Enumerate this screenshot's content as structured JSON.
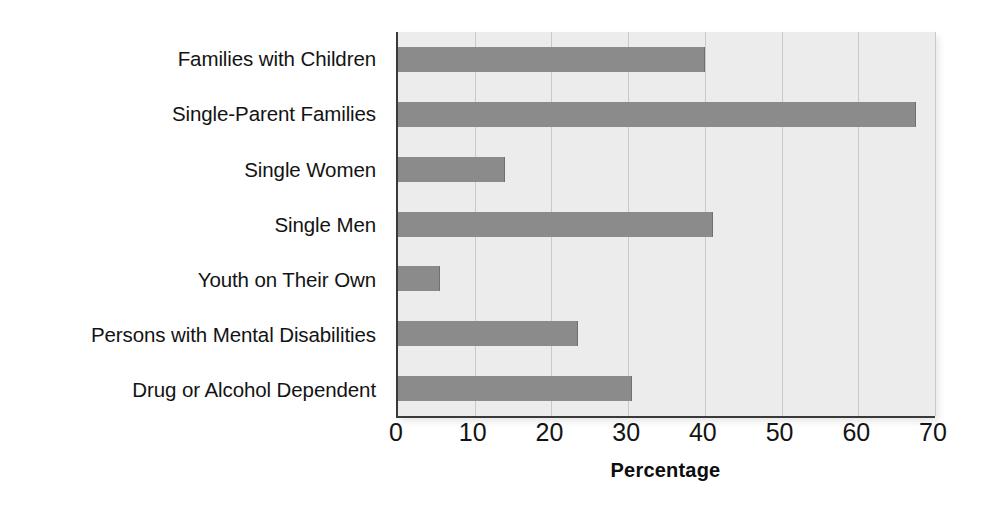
{
  "chart_data": {
    "type": "bar",
    "orientation": "horizontal",
    "title": "",
    "xlabel": "Percentage",
    "ylabel": "",
    "xlim": [
      0,
      70
    ],
    "xticks": [
      0,
      10,
      20,
      30,
      40,
      50,
      60,
      70
    ],
    "xtick_labels": [
      "0",
      "10",
      "20",
      "30",
      "40",
      "50",
      "60",
      "70"
    ],
    "grid": true,
    "legend": false,
    "categories": [
      "Families with Children",
      "Single-Parent Families",
      "Single Women",
      "Single Men",
      "Youth on Their Own",
      "Persons with Mental Disabilities",
      "Drug or Alcohol Dependent"
    ],
    "values": [
      40,
      67.5,
      14,
      41,
      5.5,
      23.5,
      30.5
    ],
    "series": [
      {
        "name": "Percentage",
        "values": [
          40,
          67.5,
          14,
          41,
          5.5,
          23.5,
          30.5
        ]
      }
    ]
  },
  "colors": {
    "bar_fill": "#8b8b8b",
    "bar_edge": "#6f6f6f",
    "plot_background": "#ececed",
    "gridline": "#c9c9cb",
    "axis_line": "#3a3a3a",
    "text": "#131313",
    "page_background": "#ffffff"
  }
}
